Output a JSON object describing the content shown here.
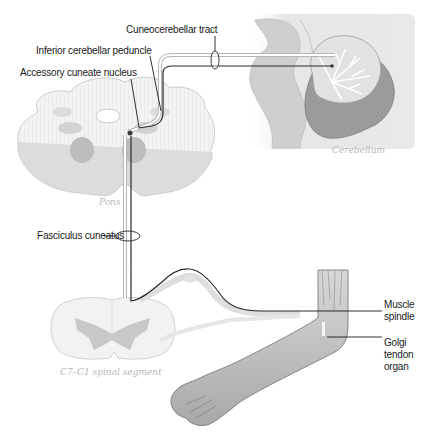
{
  "figure": {
    "labels": {
      "cuneocerebellar_tract": "Cuneocerebellar tract",
      "inferior_cerebellar_peduncle": "Inferior cerebellar peduncle",
      "accessory_cuneate_nucleus": "Accessory cuneate nucleus",
      "fasciculus_cuneatus": "Fasciculus cuneatus",
      "muscle_spindle_line1": "Muscle",
      "muscle_spindle_line2": "spindle",
      "golgi_line1": "Golgi",
      "golgi_line2": "tendon",
      "golgi_line3": "organ"
    },
    "captions": {
      "cerebellum": "Cerebellum",
      "pons": "Pons",
      "spinal_segment": "C7–C1 spinal segment"
    },
    "colors": {
      "tract": "#2a2a2a",
      "tissue_light": "#f0f0f0",
      "tissue_mid": "#d4d4d4",
      "tissue_dark": "#9a9a9a",
      "caption": "#b8b8b8"
    }
  }
}
